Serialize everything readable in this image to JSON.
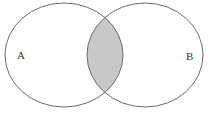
{
  "diagram": {
    "type": "venn",
    "sets": [
      {
        "id": "A",
        "label": "A"
      },
      {
        "id": "B",
        "label": "B"
      }
    ],
    "shaded_region": "A ∩ B",
    "colors": {
      "stroke": "#6b6b6b",
      "intersection_fill": "#c8c8c8",
      "background": "#ffffff",
      "label": "#333333"
    }
  }
}
